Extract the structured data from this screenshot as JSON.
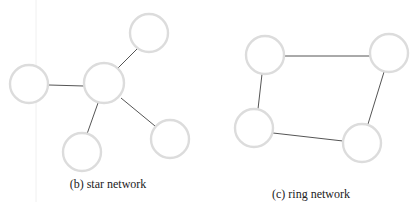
{
  "diagrams": [
    {
      "id": "star",
      "caption": "(b) star network",
      "caption_pos": {
        "x": 108,
        "y": 188
      },
      "nodes": [
        {
          "name": "hub",
          "x": 104,
          "y": 83,
          "r": 20
        },
        {
          "name": "top-right",
          "x": 149,
          "y": 33,
          "r": 19
        },
        {
          "name": "left",
          "x": 29,
          "y": 84,
          "r": 19
        },
        {
          "name": "bottom",
          "x": 82,
          "y": 152,
          "r": 19
        },
        {
          "name": "bottom-right",
          "x": 170,
          "y": 139,
          "r": 19
        }
      ],
      "edges": [
        {
          "from": "hub",
          "to": "top-right",
          "x1": 117,
          "y1": 69,
          "x2": 137,
          "y2": 49
        },
        {
          "from": "hub",
          "to": "left",
          "x1": 84,
          "y1": 86,
          "x2": 49,
          "y2": 85
        },
        {
          "from": "hub",
          "to": "bottom",
          "x1": 98,
          "y1": 103,
          "x2": 87,
          "y2": 134
        },
        {
          "from": "hub",
          "to": "bottom-right",
          "x1": 121,
          "y1": 98,
          "x2": 155,
          "y2": 126
        }
      ]
    },
    {
      "id": "ring",
      "caption": "(c) ring network",
      "caption_pos": {
        "x": 311,
        "y": 198
      },
      "nodes": [
        {
          "name": "top-left",
          "x": 265,
          "y": 55,
          "r": 19
        },
        {
          "name": "top-right",
          "x": 389,
          "y": 53,
          "r": 19
        },
        {
          "name": "bottom-right",
          "x": 362,
          "y": 143,
          "r": 19
        },
        {
          "name": "bottom-left",
          "x": 254,
          "y": 128,
          "r": 19
        }
      ],
      "edges": [
        {
          "from": "top-left",
          "to": "top-right",
          "x1": 285,
          "y1": 56,
          "x2": 370,
          "y2": 56
        },
        {
          "from": "top-right",
          "to": "bottom-right",
          "x1": 384,
          "y1": 72,
          "x2": 368,
          "y2": 124
        },
        {
          "from": "bottom-right",
          "to": "bottom-left",
          "x1": 343,
          "y1": 141,
          "x2": 273,
          "y2": 133
        },
        {
          "from": "bottom-left",
          "to": "top-left",
          "x1": 258,
          "y1": 109,
          "x2": 262,
          "y2": 74
        }
      ]
    }
  ],
  "colors": {
    "node_stroke": "#dcdcdc",
    "edge": "#555555",
    "caption": "#222222"
  }
}
